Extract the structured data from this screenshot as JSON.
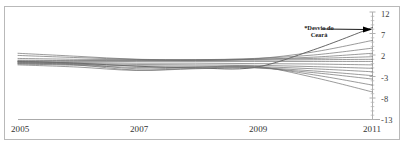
{
  "figure": {
    "background_color": "#ffffff",
    "frame_color": "#b9b9b9",
    "annotation": {
      "text": "*Desvio do\nCeará",
      "line_color": "#000000"
    }
  },
  "chart_data": {
    "type": "line",
    "title": "",
    "subtitle": "",
    "xlabel": "",
    "ylabel": "",
    "xlim": [
      2005,
      2011
    ],
    "ylim": [
      -13,
      12
    ],
    "grid": false,
    "legend": "none",
    "annotations": [
      {
        "text": "*Desvio do Ceará",
        "target_x": 2011,
        "target_y": 8.4,
        "label_x": 2008.55,
        "label_y": 10.2
      }
    ],
    "x_ticks": [
      2005,
      2007,
      2009,
      2011
    ],
    "x_tick_labels": [
      "2005",
      "2007",
      "2009",
      "2011"
    ],
    "y_ticks": [
      12,
      7,
      2,
      -3,
      -8,
      -13
    ],
    "y_tick_labels": [
      "12",
      "7",
      "2",
      "-3",
      "-8",
      "-13"
    ],
    "x": [
      2005,
      2006,
      2007,
      2008,
      2009,
      2010,
      2011
    ],
    "series": [
      {
        "name": "Ceará",
        "highlight": true,
        "values": [
          0.5,
          0.1,
          -0.6,
          -1.0,
          -0.9,
          3.2,
          8.4
        ]
      },
      {
        "name": "S2",
        "highlight": false,
        "values": [
          2.4,
          1.7,
          1.0,
          0.7,
          1.1,
          2.7,
          5.4
        ]
      },
      {
        "name": "S3",
        "highlight": false,
        "values": [
          1.9,
          1.4,
          1.0,
          0.9,
          1.2,
          2.0,
          3.6
        ]
      },
      {
        "name": "S4",
        "highlight": false,
        "values": [
          1.2,
          1.0,
          0.9,
          0.8,
          1.0,
          1.5,
          2.4
        ]
      },
      {
        "name": "S5",
        "highlight": false,
        "values": [
          0.8,
          0.7,
          0.8,
          0.9,
          1.0,
          1.2,
          1.6
        ]
      },
      {
        "name": "S6",
        "highlight": false,
        "values": [
          0.6,
          0.6,
          0.7,
          0.8,
          0.8,
          0.9,
          1.0
        ]
      },
      {
        "name": "S7",
        "highlight": false,
        "values": [
          0.4,
          0.4,
          0.5,
          0.5,
          0.5,
          0.5,
          0.5
        ]
      },
      {
        "name": "S8",
        "highlight": false,
        "values": [
          0.2,
          0.2,
          0.1,
          0.1,
          0.0,
          -0.1,
          -0.3
        ]
      },
      {
        "name": "S9",
        "highlight": false,
        "values": [
          0.1,
          0.0,
          -0.2,
          -0.3,
          -0.4,
          -0.7,
          -1.1
        ]
      },
      {
        "name": "S10",
        "highlight": false,
        "values": [
          0.0,
          -0.2,
          -0.5,
          -0.6,
          -0.7,
          -1.2,
          -1.9
        ]
      },
      {
        "name": "S11",
        "highlight": false,
        "values": [
          -0.1,
          -0.4,
          -0.9,
          -0.8,
          -0.9,
          -1.7,
          -2.8
        ]
      },
      {
        "name": "S12",
        "highlight": false,
        "values": [
          -0.3,
          -0.8,
          -1.6,
          -1.2,
          -1.0,
          -2.1,
          -3.6
        ]
      },
      {
        "name": "S13",
        "highlight": false,
        "values": [
          0.3,
          -0.3,
          -1.5,
          -1.1,
          -0.8,
          -2.6,
          -5.0
        ]
      },
      {
        "name": "S14",
        "highlight": false,
        "values": [
          0.6,
          0.0,
          -1.2,
          -0.9,
          -0.6,
          -3.2,
          -6.6
        ]
      }
    ]
  },
  "axes": {
    "x_labels": [
      "2005",
      "2007",
      "2009",
      "2011"
    ],
    "y_labels": [
      "12",
      "7",
      "2",
      "-3",
      "-8",
      "-13"
    ]
  }
}
